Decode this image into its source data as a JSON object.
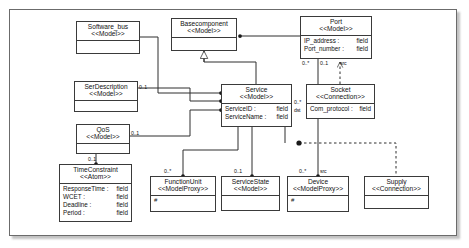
{
  "diagram": {
    "frame": {
      "stroke": "#6b6b6b",
      "fill": "#ffffff"
    },
    "classes": [
      {
        "id": "software_bus",
        "name": "Software_bus",
        "stereotype": "<<Model>>",
        "attributes": [],
        "x": 76,
        "y": 21,
        "w": 64,
        "h": 33
      },
      {
        "id": "basecomponent",
        "name": "Basecomponent",
        "stereotype": "<<Model>>",
        "attributes": [],
        "x": 171,
        "y": 18,
        "w": 66,
        "h": 33
      },
      {
        "id": "port",
        "name": "Port",
        "stereotype": "<<Model>>",
        "attributes": [
          {
            "key": "IP_address :",
            "value": "field"
          },
          {
            "key": "Port_number :",
            "value": "field"
          }
        ],
        "x": 300,
        "y": 16,
        "w": 72,
        "h": 43
      },
      {
        "id": "serdescription",
        "name": "SerDescription",
        "stereotype": "<<Model>>",
        "attributes": [],
        "x": 74,
        "y": 81,
        "w": 64,
        "h": 31
      },
      {
        "id": "service",
        "name": "Service",
        "stereotype": "<<Model>>",
        "attributes": [
          {
            "key": "ServiceID :",
            "value": "field"
          },
          {
            "key": "ServiceName :",
            "value": "field"
          }
        ],
        "x": 221,
        "y": 84,
        "w": 71,
        "h": 43
      },
      {
        "id": "socket",
        "name": "Socket",
        "stereotype": "<<Connection>>",
        "attributes": [
          {
            "key": "Com_protocol :",
            "value": "field"
          }
        ],
        "x": 306,
        "y": 84,
        "w": 69,
        "h": 35
      },
      {
        "id": "qos",
        "name": "QoS",
        "stereotype": "<<Model>>",
        "attributes": [],
        "x": 76,
        "y": 124,
        "w": 54,
        "h": 30
      },
      {
        "id": "timeconstraint",
        "name": "TimeConstraint",
        "stereotype": "<<Atom>>",
        "attributes": [
          {
            "key": "ResponseTime :",
            "value": "field"
          },
          {
            "key": "WCET :",
            "value": "field"
          },
          {
            "key": "Deadline :",
            "value": "field"
          },
          {
            "key": "Period :",
            "value": "field"
          }
        ],
        "x": 59,
        "y": 164,
        "w": 73,
        "h": 58
      },
      {
        "id": "functionunit",
        "name": "FunctionUnit",
        "stereotype": "<<ModelProxy>>",
        "attributes": [],
        "marker": "#",
        "x": 150,
        "y": 176,
        "w": 66,
        "h": 36
      },
      {
        "id": "servicestate",
        "name": "ServiceState",
        "stereotype": "<<Model>>",
        "attributes": [],
        "x": 221,
        "y": 176,
        "w": 59,
        "h": 35
      },
      {
        "id": "device",
        "name": "Device",
        "stereotype": "<<ModelProxy>>",
        "attributes": [],
        "marker": "#",
        "x": 287,
        "y": 176,
        "w": 62,
        "h": 36
      },
      {
        "id": "supply",
        "name": "Supply",
        "stereotype": "<<Connection>>",
        "attributes": [],
        "x": 364,
        "y": 176,
        "w": 65,
        "h": 33
      }
    ],
    "multiplicities": [
      {
        "id": "m-serdesc",
        "label": "0..1",
        "x": 139,
        "y": 84
      },
      {
        "id": "m-qos",
        "label": "0..1",
        "x": 131,
        "y": 130
      },
      {
        "id": "m-timeconstraint",
        "label": "0..1",
        "x": 88,
        "y": 156
      },
      {
        "id": "m-port-left",
        "label": "0..*",
        "x": 302,
        "y": 60
      },
      {
        "id": "m-port-mid",
        "label": "0..1",
        "x": 320,
        "y": 60
      },
      {
        "id": "m-port-src",
        "label": "src",
        "x": 340,
        "y": 60
      },
      {
        "id": "m-service-right",
        "label": "0..*",
        "x": 294,
        "y": 99
      },
      {
        "id": "m-service-dst",
        "label": "dst",
        "x": 294,
        "y": 107
      },
      {
        "id": "m-functionunit",
        "label": "0..*",
        "x": 164,
        "y": 168
      },
      {
        "id": "m-servicestate",
        "label": "0..1",
        "x": 234,
        "y": 168
      },
      {
        "id": "m-device",
        "label": "0..*",
        "x": 299,
        "y": 168
      },
      {
        "id": "m-device-src",
        "label": "src",
        "x": 320,
        "y": 168
      }
    ],
    "relations": [
      {
        "id": "rel-basecomponent-port",
        "type": "aggregation",
        "from": "port",
        "to": "basecomponent"
      },
      {
        "id": "rel-service-basecomponent",
        "type": "generalization",
        "from": "service",
        "to": "basecomponent"
      },
      {
        "id": "rel-softwarebus-service",
        "type": "association",
        "from": "software_bus",
        "to": "service"
      },
      {
        "id": "rel-serdescription-service",
        "type": "aggregation",
        "from": "serdescription",
        "to": "service"
      },
      {
        "id": "rel-qos-service",
        "type": "aggregation",
        "from": "qos",
        "to": "service"
      },
      {
        "id": "rel-qos-timeconstraint",
        "type": "aggregation",
        "from": "qos",
        "to": "timeconstraint"
      },
      {
        "id": "rel-service-functionunit",
        "type": "aggregation",
        "from": "service",
        "to": "functionunit"
      },
      {
        "id": "rel-service-servicestate",
        "type": "aggregation",
        "from": "service",
        "to": "servicestate"
      },
      {
        "id": "rel-port-device",
        "type": "aggregation",
        "from": "port",
        "to": "device"
      },
      {
        "id": "rel-socket-port",
        "type": "dependency",
        "from": "socket",
        "to": "port"
      },
      {
        "id": "rel-service-supply",
        "type": "dependency",
        "from": "service",
        "to": "supply"
      }
    ]
  }
}
